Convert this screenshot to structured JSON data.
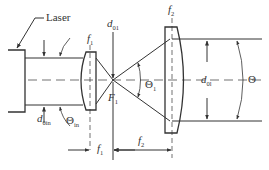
{
  "diagram": {
    "type": "optical beam expander schematic",
    "labels": {
      "laser": "Laser",
      "d01": {
        "main": "d",
        "sub": "01"
      },
      "f1_top": {
        "main": "f",
        "sub": "1"
      },
      "f2_top": {
        "main": "f",
        "sub": "2"
      },
      "theta1": {
        "main": "Θ",
        "sub": "1"
      },
      "F1": {
        "main": "F",
        "sub": "1"
      },
      "d0l": {
        "main": "d",
        "sub": "0l"
      },
      "theta_out": "Θ",
      "d0in": {
        "main": "d",
        "sub": "0in"
      },
      "theta_in": {
        "main": "Θ",
        "sub": "in"
      },
      "f1_dim": {
        "main": "f",
        "sub": "1"
      },
      "f2_dim": {
        "main": "f",
        "sub": "2"
      }
    },
    "colors": {
      "line": "#333333",
      "background": "#ffffff"
    }
  }
}
